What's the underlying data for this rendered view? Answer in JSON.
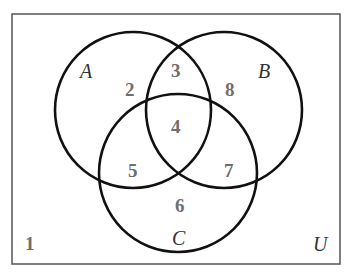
{
  "diagram": {
    "type": "venn",
    "universe_label": "U",
    "sets": [
      {
        "name": "A",
        "label": "A"
      },
      {
        "name": "B",
        "label": "B"
      },
      {
        "name": "C",
        "label": "C"
      }
    ],
    "regions": {
      "outside": "1",
      "a_only": "2",
      "a_and_b_only": "3",
      "a_b_c": "4",
      "a_and_c_only": "5",
      "c_only": "6",
      "b_and_c_only": "7",
      "b_only": "8"
    },
    "colors": {
      "stroke": "#111111",
      "numbers": "#6e6e6e",
      "labels": "#333333",
      "background": "#ffffff"
    }
  }
}
